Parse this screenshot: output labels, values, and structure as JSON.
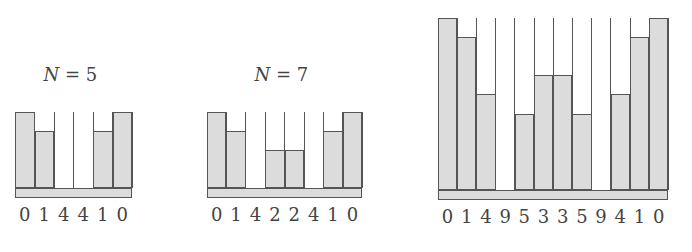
{
  "diagrams": [
    {
      "title_var": "N",
      "title_eq": " = 5",
      "levels": 4,
      "labels": [
        "0",
        "1",
        "4",
        "4",
        "1",
        "0"
      ],
      "heights": [
        4,
        3,
        0,
        0,
        3,
        4
      ],
      "geom": {
        "left": 15,
        "top": 112,
        "colw": 19.5,
        "unit": 19,
        "base_h": 10
      }
    },
    {
      "title_var": "N",
      "title_eq": " = 7",
      "levels": 4,
      "labels": [
        "0",
        "1",
        "4",
        "2",
        "2",
        "4",
        "1",
        "0"
      ],
      "heights": [
        4,
        3,
        0,
        2,
        2,
        0,
        3,
        4
      ],
      "geom": {
        "left": 207,
        "top": 112,
        "colw": 19.4,
        "unit": 19,
        "base_h": 10
      }
    },
    {
      "title_var": "",
      "title_eq": "",
      "levels": 9,
      "labels": [
        "0",
        "1",
        "4",
        "9",
        "5",
        "3",
        "3",
        "5",
        "9",
        "4",
        "1",
        "0"
      ],
      "heights": [
        9,
        8,
        5,
        0,
        4,
        6,
        6,
        4,
        0,
        5,
        8,
        9
      ],
      "geom": {
        "left": 438,
        "top": 18,
        "colw": 19.2,
        "unit": 19.1,
        "base_h": 10
      }
    }
  ],
  "colors": {
    "fill": "#dcdcdc",
    "stroke": "#555555",
    "background": "#ffffff"
  }
}
